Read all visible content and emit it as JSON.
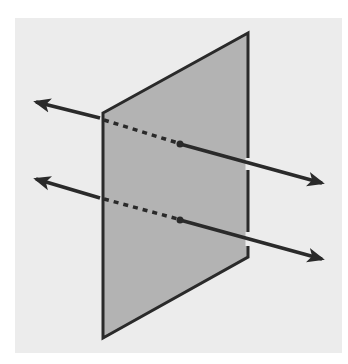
{
  "diagram": {
    "colors": {
      "page_background": "#ffffff",
      "panel_background": "#ececec",
      "plane_fill": "#b3b3b3",
      "stroke": "#2a2a2a"
    },
    "panel": {
      "x": 15,
      "y": 18,
      "width": 327,
      "height": 335
    },
    "plane": {
      "points": [
        [
          103,
          113
        ],
        [
          248,
          33
        ],
        [
          248,
          257
        ],
        [
          103,
          338
        ]
      ]
    },
    "lines": [
      {
        "name": "upper-line",
        "left_tip": [
          30,
          100
        ],
        "enter_plane": [
          100,
          118
        ],
        "dot": [
          180,
          144
        ],
        "right_tip": [
          328,
          184
        ]
      },
      {
        "name": "lower-line",
        "left_tip": [
          30,
          177
        ],
        "enter_plane": [
          100,
          198
        ],
        "dot": [
          180,
          220
        ],
        "right_tip": [
          328,
          260
        ]
      }
    ]
  }
}
